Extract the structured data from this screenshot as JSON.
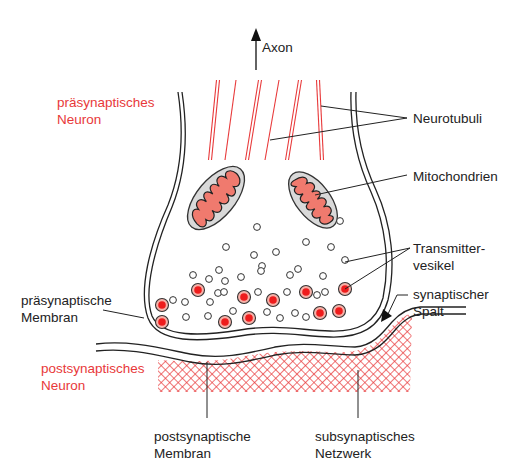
{
  "figure": {
    "colors": {
      "red": "#e8393a",
      "mito_fill": "#f07a6e",
      "mito_outer": "#d6d6d6",
      "vesicle_fill": "#ee1c1c",
      "vesicle_halo": "#f7b1a8",
      "line": "#222222"
    }
  },
  "labels": {
    "axon": "Axon",
    "presynaptic_neuron": [
      "präsynaptisches",
      "Neuron"
    ],
    "neurotubuli": "Neurotubuli",
    "mitochondrien": "Mitochondrien",
    "transmittervesikel": [
      "Transmitter-",
      "vesikel"
    ],
    "presynaptic_membrane": [
      "präsynaptische",
      "Membran"
    ],
    "synaptic_cleft": [
      "synaptischer",
      "Spalt"
    ],
    "postsynaptic_neuron": [
      "postsynaptisches",
      "Neuron"
    ],
    "postsynaptic_membrane": [
      "postsynaptische",
      "Membran"
    ],
    "subsynaptic_network": [
      "subsynaptisches",
      "Netzwerk"
    ]
  },
  "structures": {
    "neurotubuli_count": 6,
    "mitochondria_count": 2,
    "empty_vesicles": [
      [
        257,
        227
      ],
      [
        340,
        221
      ],
      [
        226,
        247
      ],
      [
        254,
        255
      ],
      [
        276,
        252
      ],
      [
        306,
        242
      ],
      [
        331,
        247
      ],
      [
        219,
        270
      ],
      [
        262,
        266
      ],
      [
        298,
        269
      ],
      [
        345,
        260
      ],
      [
        193,
        275
      ],
      [
        209,
        279
      ],
      [
        225,
        281
      ],
      [
        241,
        277
      ],
      [
        290,
        275
      ],
      [
        323,
        276
      ],
      [
        173,
        300
      ],
      [
        218,
        293
      ],
      [
        185,
        302
      ],
      [
        210,
        302
      ],
      [
        258,
        292
      ],
      [
        261,
        271
      ],
      [
        287,
        292
      ],
      [
        325,
        292
      ],
      [
        186,
        317
      ],
      [
        208,
        316
      ],
      [
        233,
        311
      ],
      [
        267,
        312
      ],
      [
        280,
        318
      ],
      [
        295,
        313
      ],
      [
        306,
        317
      ],
      [
        317,
        295
      ],
      [
        224,
        292
      ]
    ],
    "filled_vesicles": [
      [
        162,
        305
      ],
      [
        198,
        290
      ],
      [
        244,
        297
      ],
      [
        273,
        300
      ],
      [
        306,
        292
      ],
      [
        345,
        289
      ],
      [
        162,
        322
      ],
      [
        225,
        322
      ],
      [
        249,
        318
      ],
      [
        320,
        313
      ],
      [
        339,
        311
      ]
    ]
  }
}
